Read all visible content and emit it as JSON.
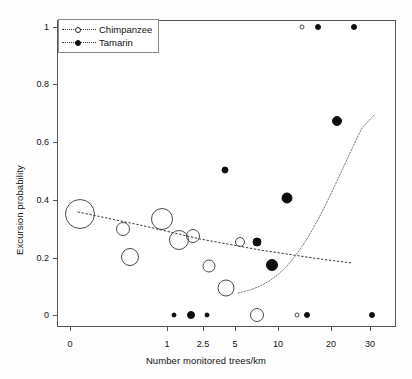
{
  "chart_data": {
    "type": "scatter",
    "title": "",
    "xlabel": "Number monitored trees/km",
    "ylabel": "Excursion probability",
    "xscale": "log-like",
    "xticks": [
      0,
      1,
      2.5,
      5,
      10,
      20,
      30
    ],
    "xtick_labels": [
      "0",
      "1",
      "2.5",
      "5",
      "10",
      "20",
      "30"
    ],
    "yticks": [
      0,
      0.2,
      0.4,
      0.6,
      0.8,
      1
    ],
    "ytick_labels": [
      "0",
      "0.2",
      "0.4",
      "0.6",
      "0.8",
      "1"
    ],
    "ylim": [
      0,
      1
    ],
    "grid": false,
    "legend_position": "top-left",
    "note": "Bubble area encodes sample size / weight per point.",
    "series": [
      {
        "name": "Chimpanzee",
        "marker": "open-circle",
        "color": "#4a4a4a",
        "fit_line": "dotted-declining",
        "points": [
          {
            "x": 0.1,
            "y": 0.35,
            "size": 30
          },
          {
            "x": 0.55,
            "y": 0.3,
            "size": 14
          },
          {
            "x": 0.62,
            "y": 0.2,
            "size": 18
          },
          {
            "x": 0.95,
            "y": 0.335,
            "size": 22
          },
          {
            "x": 1.5,
            "y": 0.26,
            "size": 20
          },
          {
            "x": 2.1,
            "y": 0.275,
            "size": 14
          },
          {
            "x": 3.0,
            "y": 0.17,
            "size": 13
          },
          {
            "x": 4.3,
            "y": 0.095,
            "size": 17
          },
          {
            "x": 5.6,
            "y": 0.253,
            "size": 10
          },
          {
            "x": 7.5,
            "y": 0.0,
            "size": 14
          },
          {
            "x": 13.5,
            "y": 0.0,
            "size": 5
          },
          {
            "x": 14.5,
            "y": 1.0,
            "size": 5
          }
        ]
      },
      {
        "name": "Tamarin",
        "marker": "filled-circle",
        "color": "#0d0d0d",
        "fit_line": "dotted-rising",
        "points": [
          {
            "x": 1.3,
            "y": 0.0,
            "size": 5
          },
          {
            "x": 2.0,
            "y": 0.0,
            "size": 8
          },
          {
            "x": 2.8,
            "y": 0.0,
            "size": 5
          },
          {
            "x": 4.2,
            "y": 0.505,
            "size": 7
          },
          {
            "x": 7.6,
            "y": 0.253,
            "size": 9
          },
          {
            "x": 9.3,
            "y": 0.175,
            "size": 12
          },
          {
            "x": 11.7,
            "y": 0.405,
            "size": 11
          },
          {
            "x": 15.5,
            "y": 0.0,
            "size": 6
          },
          {
            "x": 17.5,
            "y": 1.0,
            "size": 6
          },
          {
            "x": 21.5,
            "y": 0.672,
            "size": 10
          },
          {
            "x": 26.0,
            "y": 1.0,
            "size": 6
          },
          {
            "x": 30.5,
            "y": 0.0,
            "size": 6
          }
        ]
      }
    ]
  },
  "legend": {
    "items": [
      {
        "label": "Chimpanzee",
        "marker": "open-circle"
      },
      {
        "label": "Tamarin",
        "marker": "filled-circle"
      }
    ]
  },
  "axes": {
    "x": {
      "title": "Number monitored trees/km",
      "ticks": [
        {
          "label": "0",
          "px": 70
        },
        {
          "label": "1",
          "px": 167
        },
        {
          "label": "2.5",
          "px": 203
        },
        {
          "label": "5",
          "px": 235
        },
        {
          "label": "10",
          "px": 278
        },
        {
          "label": "20",
          "px": 331
        },
        {
          "label": "30",
          "px": 370
        }
      ]
    },
    "y": {
      "title": "Excursion probability",
      "ticks": [
        {
          "label": "1",
          "px": 27
        },
        {
          "label": "0.8",
          "px": 84
        },
        {
          "label": "0.6",
          "px": 142
        },
        {
          "label": "0.4",
          "px": 200
        },
        {
          "label": "0.2",
          "px": 258
        },
        {
          "label": "0",
          "px": 315
        }
      ]
    }
  }
}
